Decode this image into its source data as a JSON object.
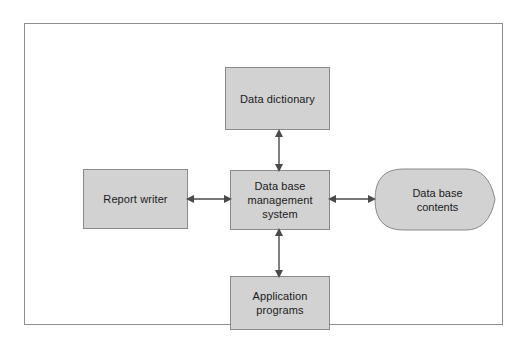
{
  "diagram": {
    "frame": {
      "border_color": "#8d8d8d"
    },
    "node_fill_color": "#d2d2d2",
    "node_border_color": "#8a8a8a",
    "arrow_color": "#4a4a4a",
    "nodes": [
      {
        "id": "data-dictionary",
        "label": "Data dictionary",
        "shape": "rectangle"
      },
      {
        "id": "report-writer",
        "label": "Report writer",
        "shape": "rectangle"
      },
      {
        "id": "dbms",
        "label": "Data base\nmanagement\nsystem",
        "shape": "rectangle"
      },
      {
        "id": "application-programs",
        "label": "Application\nprograms",
        "shape": "rectangle"
      },
      {
        "id": "database-contents",
        "label": "Data base\ncontents",
        "shape": "data-store"
      }
    ],
    "connectors": [
      {
        "id": "dictionary-dbms",
        "from": "data-dictionary",
        "to": "dbms",
        "style": "double-arrow",
        "orientation": "vertical"
      },
      {
        "id": "report-dbms",
        "from": "report-writer",
        "to": "dbms",
        "style": "double-arrow",
        "orientation": "horizontal"
      },
      {
        "id": "dbms-database",
        "from": "dbms",
        "to": "database-contents",
        "style": "double-arrow",
        "orientation": "horizontal"
      },
      {
        "id": "dbms-application",
        "from": "dbms",
        "to": "application-programs",
        "style": "double-arrow",
        "orientation": "vertical"
      }
    ]
  }
}
